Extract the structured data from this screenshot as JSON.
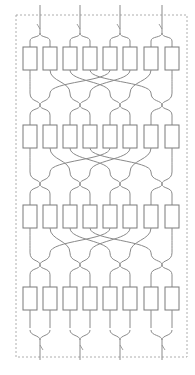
{
  "diagram": {
    "type": "network-diagram",
    "colors": {
      "stroke": "#8a8a8a",
      "box_stroke": "#7a7a7a",
      "border": "#9a9a9a",
      "background": "#ffffff"
    },
    "border": {
      "x": 16,
      "y": 15,
      "width": 171,
      "height": 342,
      "style": "dashed"
    },
    "box": {
      "width": 14,
      "height": 23
    },
    "box_x": [
      23,
      43,
      63,
      83,
      103,
      123,
      144,
      165
    ],
    "stages": [
      {
        "id": "stage-1",
        "box_y": 47
      },
      {
        "id": "stage-2",
        "box_y": 125
      },
      {
        "id": "stage-3",
        "box_y": 205
      },
      {
        "id": "stage-4",
        "box_y": 287
      }
    ],
    "merge_x": [
      40,
      80,
      120,
      162
    ],
    "inputs_top_y": 5,
    "outputs_bottom_y": 370,
    "node_count_per_stage": 8,
    "stage_count": 4
  },
  "caption": {
    "text": ""
  }
}
